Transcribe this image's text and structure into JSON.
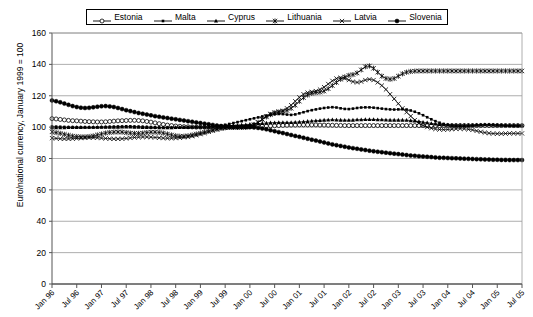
{
  "chart_data": {
    "type": "line",
    "title": "",
    "xlabel": "",
    "ylabel": "Euro/national currency, January 1999 = 100",
    "ylim": [
      0,
      160
    ],
    "yticks": [
      0,
      20,
      40,
      60,
      80,
      100,
      120,
      140,
      160
    ],
    "grid": "horizontal",
    "legend_position": "top",
    "x_tick_labels": [
      "Jan 96",
      "Jul 96",
      "Jan 97",
      "Jul 97",
      "Jan 98",
      "Jul 98",
      "Jan 99",
      "Jul 99",
      "Jan 00",
      "Jul 00",
      "Jan 01",
      "Jul 01",
      "Jan 02",
      "Jul 02",
      "Jan 03",
      "Jul 03",
      "Jan 04",
      "Jul 04",
      "Jan 05",
      "Jul 05"
    ],
    "x_start": "Jan 96",
    "x_end": "Jul 05",
    "x_frequency": "monthly",
    "n_points": 115,
    "series": [
      {
        "name": "Estonia",
        "marker": "open-circle",
        "values": [
          105.4,
          105.2,
          104.9,
          104.6,
          104.3,
          104.1,
          104.0,
          103.8,
          103.6,
          103.5,
          103.4,
          103.3,
          103.3,
          103.4,
          103.6,
          103.8,
          104.0,
          104.1,
          104.2,
          104.3,
          104.3,
          104.2,
          104.0,
          103.6,
          103.2,
          102.7,
          102.2,
          101.7,
          101.3,
          101.0,
          100.7,
          100.5,
          100.3,
          100.2,
          100.1,
          100.0,
          100.0,
          100.0,
          100.0,
          100.0,
          100.0,
          100.0,
          100.0,
          100.0,
          100.0,
          100.0,
          100.1,
          100.2,
          100.3,
          100.4,
          100.5,
          100.6,
          100.7,
          100.8,
          100.9,
          101.0,
          101.1,
          101.2,
          101.3,
          101.3,
          101.4,
          101.4,
          101.4,
          101.4,
          101.4,
          101.3,
          101.3,
          101.2,
          101.2,
          101.1,
          101.1,
          101.0,
          101.0,
          101.0,
          101.0,
          101.0,
          101.0,
          101.0,
          101.0,
          101.0,
          101.0,
          101.0,
          101.0,
          101.0,
          101.0,
          101.0,
          101.0,
          101.0,
          101.0,
          101.0,
          101.0,
          101.0,
          101.0,
          101.0,
          101.0,
          101.0,
          101.0,
          101.0,
          101.0,
          101.0,
          101.0,
          101.0,
          101.0,
          101.0,
          101.0,
          101.0,
          101.0,
          101.0,
          101.0,
          101.0,
          101.0,
          101.0,
          101.0,
          101.0,
          101.0
        ]
      },
      {
        "name": "Malta",
        "marker": "small-filled-square",
        "values": [
          100.4,
          100.3,
          100.2,
          100.1,
          100.0,
          100.0,
          99.9,
          99.9,
          99.8,
          99.8,
          99.8,
          99.9,
          100.0,
          100.1,
          100.2,
          100.3,
          100.4,
          100.4,
          100.5,
          100.5,
          100.4,
          100.3,
          100.2,
          100.1,
          100.0,
          99.9,
          99.8,
          99.7,
          99.6,
          99.6,
          99.6,
          99.7,
          99.8,
          99.9,
          100.0,
          100.0,
          100.0,
          100.0,
          100.1,
          100.3,
          100.6,
          101.0,
          101.5,
          102.0,
          102.6,
          103.2,
          103.8,
          104.4,
          105.0,
          105.6,
          106.2,
          106.8,
          107.3,
          107.8,
          108.2,
          108.4,
          108.3,
          108.0,
          107.8,
          108.1,
          108.8,
          109.5,
          110.2,
          110.8,
          111.3,
          111.8,
          112.2,
          112.5,
          112.7,
          112.5,
          112.0,
          111.6,
          111.5,
          111.8,
          112.2,
          112.5,
          112.6,
          112.6,
          112.4,
          112.1,
          111.8,
          111.5,
          111.3,
          111.2,
          111.3,
          111.4,
          111.2,
          110.6,
          109.8,
          108.8,
          107.6,
          106.3,
          105.0,
          103.8,
          102.8,
          102.0,
          101.4,
          101.0,
          100.8,
          100.7,
          100.7,
          100.8,
          101.0,
          101.2,
          101.4,
          101.5,
          101.5,
          101.4,
          101.3,
          101.2,
          101.1,
          101.0,
          101.0,
          101.0,
          101.0
        ]
      },
      {
        "name": "Cyprus",
        "marker": "filled-triangle",
        "values": [
          99.6,
          99.6,
          99.7,
          99.7,
          99.8,
          99.8,
          99.9,
          99.9,
          100.0,
          100.0,
          100.0,
          100.0,
          100.0,
          100.0,
          100.0,
          100.0,
          100.0,
          100.1,
          100.1,
          100.1,
          100.0,
          100.0,
          99.9,
          99.9,
          99.8,
          99.8,
          99.7,
          99.7,
          99.7,
          99.7,
          99.8,
          99.8,
          99.9,
          99.9,
          100.0,
          100.0,
          100.0,
          100.0,
          100.0,
          100.1,
          100.2,
          100.4,
          100.6,
          100.8,
          101.0,
          101.2,
          101.4,
          101.6,
          101.8,
          102.0,
          102.2,
          102.4,
          102.6,
          102.8,
          102.9,
          103.0,
          103.0,
          103.0,
          103.0,
          103.1,
          103.3,
          103.5,
          103.7,
          103.9,
          104.1,
          104.3,
          104.5,
          104.6,
          104.7,
          104.6,
          104.5,
          104.4,
          104.4,
          104.5,
          104.7,
          104.8,
          104.9,
          104.9,
          104.9,
          104.8,
          104.7,
          104.6,
          104.5,
          104.5,
          104.5,
          104.5,
          104.4,
          104.2,
          103.9,
          103.6,
          103.2,
          102.8,
          102.4,
          102.1,
          101.8,
          101.6,
          101.4,
          101.3,
          101.2,
          101.2,
          101.2,
          101.2,
          101.3,
          101.4,
          101.4,
          101.5,
          101.5,
          101.4,
          101.3,
          101.2,
          101.1,
          101.1,
          101.0,
          101.0,
          101.0
        ]
      },
      {
        "name": "Lithuania",
        "marker": "open-star",
        "values": [
          97.0,
          96.5,
          96.0,
          95.4,
          94.8,
          94.3,
          94.0,
          93.8,
          93.8,
          94.0,
          94.4,
          95.0,
          95.6,
          96.2,
          96.6,
          96.8,
          96.9,
          96.8,
          96.5,
          96.2,
          96.0,
          96.0,
          96.2,
          96.5,
          96.8,
          96.8,
          96.6,
          96.2,
          95.6,
          95.0,
          94.5,
          94.2,
          94.2,
          94.5,
          95.0,
          95.6,
          96.2,
          96.8,
          97.4,
          98.0,
          98.6,
          99.2,
          99.6,
          99.9,
          100.0,
          100.0,
          100.0,
          100.0,
          100.4,
          101.5,
          103.0,
          104.8,
          106.5,
          108.0,
          109.0,
          109.6,
          110.0,
          110.6,
          112.0,
          114.0,
          116.5,
          118.8,
          120.5,
          121.5,
          122.0,
          122.3,
          123.0,
          124.5,
          126.5,
          128.5,
          130.5,
          132.0,
          133.0,
          133.5,
          134.5,
          136.5,
          138.5,
          139.0,
          137.5,
          135.0,
          132.5,
          131.0,
          130.5,
          131.0,
          132.5,
          134.0,
          135.0,
          135.5,
          135.7,
          135.8,
          135.8,
          135.8,
          135.8,
          135.8,
          135.8,
          135.8,
          135.8,
          135.8,
          135.8,
          135.8,
          135.8,
          135.8,
          135.8,
          135.8,
          135.8,
          135.8,
          135.8,
          135.8,
          135.8,
          135.8,
          135.8,
          135.8,
          135.8,
          135.8,
          135.8
        ]
      },
      {
        "name": "Latvia",
        "marker": "open-x",
        "values": [
          93.0,
          92.8,
          92.6,
          92.5,
          92.5,
          92.6,
          92.8,
          93.0,
          93.2,
          93.3,
          93.3,
          93.2,
          93.0,
          92.8,
          92.6,
          92.5,
          92.5,
          92.6,
          92.8,
          93.1,
          93.4,
          93.6,
          93.7,
          93.7,
          93.6,
          93.4,
          93.2,
          93.0,
          92.9,
          92.9,
          93.0,
          93.2,
          93.5,
          93.8,
          94.2,
          94.8,
          95.5,
          96.2,
          97.0,
          97.8,
          98.5,
          99.1,
          99.5,
          99.8,
          100.0,
          100.0,
          100.0,
          100.0,
          100.5,
          101.5,
          103.0,
          105.0,
          107.0,
          108.5,
          109.5,
          110.0,
          110.5,
          112.0,
          114.0,
          116.5,
          119.0,
          121.0,
          122.0,
          122.5,
          123.0,
          124.0,
          125.5,
          127.5,
          129.5,
          131.0,
          131.5,
          131.0,
          130.0,
          129.0,
          128.5,
          129.0,
          130.0,
          130.5,
          130.0,
          128.5,
          126.5,
          124.0,
          121.0,
          118.0,
          115.0,
          112.0,
          109.5,
          107.0,
          104.5,
          102.5,
          101.0,
          100.0,
          99.3,
          98.8,
          98.5,
          98.4,
          98.5,
          98.7,
          98.9,
          99.0,
          98.9,
          98.6,
          98.2,
          97.6,
          97.0,
          96.5,
          96.1,
          95.9,
          95.8,
          95.8,
          95.9,
          96.0,
          96.0,
          96.0,
          96.0
        ]
      },
      {
        "name": "Slovenia",
        "marker": "filled-circle",
        "values": [
          117.0,
          116.5,
          115.8,
          115.0,
          114.2,
          113.4,
          112.8,
          112.4,
          112.2,
          112.3,
          112.6,
          113.0,
          113.3,
          113.4,
          113.2,
          112.8,
          112.2,
          111.5,
          110.8,
          110.2,
          109.6,
          109.0,
          108.5,
          108.0,
          107.5,
          107.0,
          106.6,
          106.2,
          105.8,
          105.4,
          105.0,
          104.6,
          104.2,
          103.8,
          103.4,
          103.0,
          102.6,
          102.2,
          101.8,
          101.4,
          101.0,
          100.7,
          100.4,
          100.2,
          100.0,
          100.0,
          100.0,
          100.0,
          100.0,
          99.8,
          99.5,
          99.1,
          98.6,
          98.0,
          97.4,
          96.8,
          96.2,
          95.6,
          95.0,
          94.4,
          93.8,
          93.2,
          92.6,
          92.0,
          91.4,
          90.8,
          90.2,
          89.6,
          89.0,
          88.5,
          88.0,
          87.5,
          87.0,
          86.6,
          86.2,
          85.8,
          85.4,
          85.0,
          84.6,
          84.3,
          84.0,
          83.7,
          83.4,
          83.1,
          82.8,
          82.5,
          82.2,
          81.9,
          81.7,
          81.5,
          81.3,
          81.1,
          80.9,
          80.7,
          80.5,
          80.4,
          80.3,
          80.2,
          80.1,
          80.0,
          79.9,
          79.8,
          79.7,
          79.6,
          79.5,
          79.4,
          79.3,
          79.2,
          79.2,
          79.1,
          79.1,
          79.0,
          79.0,
          79.0,
          79.0
        ]
      }
    ]
  },
  "legend": {
    "items": [
      {
        "label": "Estonia",
        "marker": "open-circle"
      },
      {
        "label": "Malta",
        "marker": "small-filled-square"
      },
      {
        "label": "Cyprus",
        "marker": "filled-triangle"
      },
      {
        "label": "Lithuania",
        "marker": "open-star"
      },
      {
        "label": "Latvia",
        "marker": "open-x"
      },
      {
        "label": "Slovenia",
        "marker": "filled-circle"
      }
    ]
  },
  "colors": {
    "line": "#000000",
    "grid": "#999999",
    "axis": "#555555",
    "background": "#ffffff"
  }
}
